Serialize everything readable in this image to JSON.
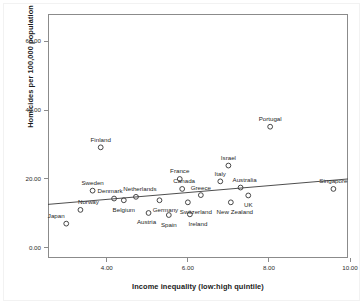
{
  "chart_data": {
    "type": "scatter",
    "title": "",
    "xlabel": "Income inequality (low:high quintile)",
    "ylabel": "Homicides per 100,000 population",
    "xlim": [
      2.55,
      9.95
    ],
    "ylim": [
      -3.0,
      68.0
    ],
    "xticks": [
      "4.00",
      "6.00",
      "8.00",
      "10.00"
    ],
    "xtick_values": [
      4.0,
      6.0,
      8.0,
      10.0
    ],
    "yticks": [
      "0.00",
      "20.00",
      "40.00",
      "60.00"
    ],
    "ytick_values": [
      0.0,
      20.0,
      40.0,
      60.0
    ],
    "grid": false,
    "legend": "none",
    "marker": "open-circle",
    "marker_color": "#333333",
    "fit_line": {
      "type": "linear",
      "color": "#3a3a3a",
      "x_start": 2.55,
      "y_start": 12.6,
      "x_end": 9.95,
      "y_end": 20.0
    },
    "labels": [
      "Japan",
      "Norway",
      "Sweden",
      "Finland",
      "Denmark",
      "Belgium",
      "Netherlands",
      "Austria",
      "Germany",
      "Spain",
      "France",
      "Canada",
      "Switzerland",
      "Ireland",
      "Greece",
      "Italy",
      "Israel",
      "New Zealand",
      "Australia",
      "UK",
      "Portugal",
      "Singapore"
    ],
    "points": [
      {
        "label": "Japan",
        "x": 3.0,
        "y": 7.0,
        "label_dx": -10,
        "label_dy": -8
      },
      {
        "label": "Norway",
        "x": 3.35,
        "y": 11.0,
        "label_dx": 8,
        "label_dy": -8
      },
      {
        "label": "Sweden",
        "x": 3.65,
        "y": 16.6,
        "label_dx": 0,
        "label_dy": -8
      },
      {
        "label": "Finland",
        "x": 3.85,
        "y": 29.2,
        "label_dx": 0,
        "label_dy": -8
      },
      {
        "label": "Denmark",
        "x": 4.18,
        "y": 14.3,
        "label_dx": -4,
        "label_dy": -8
      },
      {
        "label": "Belgium",
        "x": 4.42,
        "y": 13.8,
        "label_dx": 0,
        "label_dy": 9
      },
      {
        "label": "Netherlands",
        "x": 4.72,
        "y": 14.8,
        "label_dx": 4,
        "label_dy": -8
      },
      {
        "label": "Austria",
        "x": 5.03,
        "y": 10.1,
        "label_dx": -2,
        "label_dy": 9
      },
      {
        "label": "Germany",
        "x": 5.3,
        "y": 13.8,
        "label_dx": 6,
        "label_dy": 9
      },
      {
        "label": "Spain",
        "x": 5.53,
        "y": 9.5,
        "label_dx": 0,
        "label_dy": 9
      },
      {
        "label": "France",
        "x": 5.8,
        "y": 20.0,
        "label_dx": 0,
        "label_dy": -8
      },
      {
        "label": "Canada",
        "x": 5.86,
        "y": 17.1,
        "label_dx": 2,
        "label_dy": -8
      },
      {
        "label": "Switzerland",
        "x": 6.0,
        "y": 13.2,
        "label_dx": 8,
        "label_dy": 9
      },
      {
        "label": "Ireland",
        "x": 6.05,
        "y": 9.7,
        "label_dx": 8,
        "label_dy": 9
      },
      {
        "label": "Greece",
        "x": 6.32,
        "y": 15.3,
        "label_dx": 0,
        "label_dy": -8
      },
      {
        "label": "Italy",
        "x": 6.8,
        "y": 19.3,
        "label_dx": 0,
        "label_dy": -8
      },
      {
        "label": "Israel",
        "x": 7.0,
        "y": 23.9,
        "label_dx": 0,
        "label_dy": -8
      },
      {
        "label": "New Zealand",
        "x": 7.06,
        "y": 13.2,
        "label_dx": 4,
        "label_dy": 9
      },
      {
        "label": "Australia",
        "x": 7.3,
        "y": 17.5,
        "label_dx": 4,
        "label_dy": -8
      },
      {
        "label": "UK",
        "x": 7.49,
        "y": 15.2,
        "label_dx": 0,
        "label_dy": 9
      },
      {
        "label": "Portugal",
        "x": 8.03,
        "y": 35.2,
        "label_dx": 0,
        "label_dy": -8
      },
      {
        "label": "Singapore",
        "x": 9.59,
        "y": 17.1,
        "label_dx": 0,
        "label_dy": -8
      }
    ]
  }
}
